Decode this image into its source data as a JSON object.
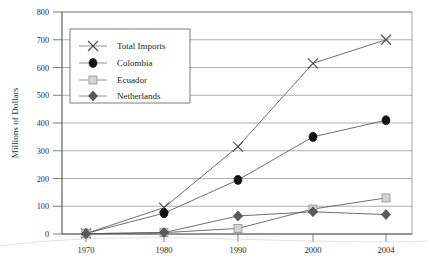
{
  "chart_data": {
    "type": "line",
    "title": "",
    "xlabel": "",
    "ylabel": "Millions of Dollars",
    "x": [
      1970,
      1980,
      1990,
      2000,
      2004
    ],
    "categories": [
      "1970",
      "1980",
      "1990",
      "2000",
      "2004"
    ],
    "ylim": [
      0,
      800
    ],
    "yticks": [
      0,
      100,
      200,
      300,
      400,
      500,
      600,
      700,
      800
    ],
    "ytick_labels": [
      "0",
      "100",
      "200",
      "300",
      "400",
      "500",
      "600",
      "700",
      "800"
    ],
    "grid": true,
    "legend_position": "upper left",
    "series": [
      {
        "name": "Total Imports",
        "marker": "x-cross",
        "color": "#4a4a4a",
        "values": [
          2,
          95,
          315,
          615,
          700
        ]
      },
      {
        "name": "Colombia",
        "marker": "filled-circle",
        "color": "#111111",
        "values": [
          2,
          75,
          195,
          350,
          410
        ]
      },
      {
        "name": "Ecuador",
        "marker": "open-square",
        "color": "#c9c9c9",
        "values": [
          1,
          5,
          20,
          90,
          130
        ]
      },
      {
        "name": "Netherlands",
        "marker": "filled-diamond",
        "color": "#5a5a5a",
        "values": [
          1,
          5,
          65,
          80,
          70
        ]
      }
    ]
  },
  "legend": {
    "entries": [
      {
        "label": "Total Imports"
      },
      {
        "label": "Colombia"
      },
      {
        "label": "Ecuador"
      },
      {
        "label": "Netherlands"
      }
    ]
  },
  "axes": {
    "y_axis_title": "Millions of Dollars"
  }
}
